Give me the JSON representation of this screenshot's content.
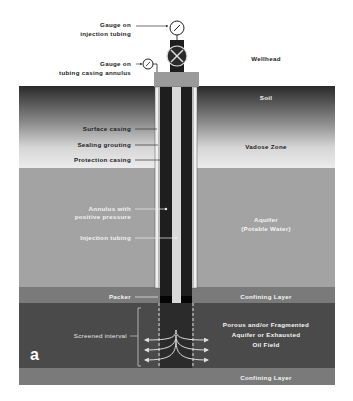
{
  "figure_label": "a",
  "colors": {
    "soil_top": "#2e2e2e",
    "vadose_bottom": "#ececec",
    "aquifer": "#a3a3a3",
    "confining": "#7a7a7a",
    "porous": "#4a4a4a",
    "wellhead_block": "#9a9a9a",
    "casing_dark": "#1e1e1e",
    "tubing": "#d9d9d9"
  },
  "wellhead": {
    "title": "Wellhead",
    "gauge_injection": [
      "Gauge on",
      "injection tubing"
    ],
    "gauge_annulus": [
      "Gauge on",
      "tubing casing annulus"
    ]
  },
  "layers": {
    "soil": "Soil",
    "vadose": "Vadose Zone",
    "aquifer": [
      "Aquifer",
      "(Potable Water)"
    ],
    "confining_top": "Confining Layer",
    "porous": [
      "Porous and/or Fragmented",
      "Aquifer or Exhausted",
      "Oil Field"
    ],
    "confining_bottom": "Confining Layer"
  },
  "well_labels": {
    "surface_casing": "Surface casing",
    "sealing_grouting": "Sealing grouting",
    "protection_casing": "Protection casing",
    "annulus": [
      "Annulus with",
      "positive pressure"
    ],
    "injection_tubing": "Injection tubing",
    "packer": "Packer",
    "screened_interval": "Screened interval"
  }
}
